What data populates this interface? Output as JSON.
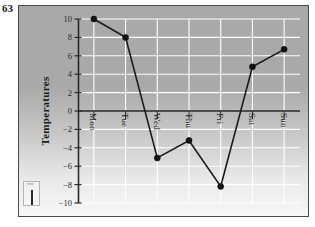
{
  "figure": {
    "number": "63"
  },
  "legend": {
    "tiny_label": "Temp",
    "marker_name": "line-marker"
  },
  "chart_data": {
    "type": "line",
    "title": "",
    "subtitle": "",
    "xlabel": "",
    "ylabel": "Temperatures",
    "categories": [
      "Mon",
      "Tue",
      "Wed",
      "Thu",
      "Fri",
      "Sat",
      "Sun"
    ],
    "values": [
      10,
      8,
      -5.1,
      -3.2,
      -8.2,
      4.8,
      6.7
    ],
    "series": [
      {
        "name": "Temperatures",
        "values": [
          10,
          8,
          -5.1,
          -3.2,
          -8.2,
          4.8,
          6.7
        ]
      }
    ],
    "ylim": [
      -10,
      10
    ],
    "ytick_labels": [
      "10",
      "8",
      "6",
      "4",
      "2",
      "0",
      "-2",
      "-4",
      "-6",
      "-8",
      "-10"
    ],
    "ytick_values": [
      10,
      8,
      6,
      4,
      2,
      0,
      -2,
      -4,
      -6,
      -8,
      -10
    ],
    "grid": true,
    "legend_position": "bottom-left",
    "line_color": "#1a1a1a",
    "marker_color": "#111111",
    "gridline_color": "#ffffff",
    "axis_color": "#2a2a2a",
    "plot_bg_top": "#a9a9a9",
    "plot_bg_bottom": "#f7f7f7"
  }
}
